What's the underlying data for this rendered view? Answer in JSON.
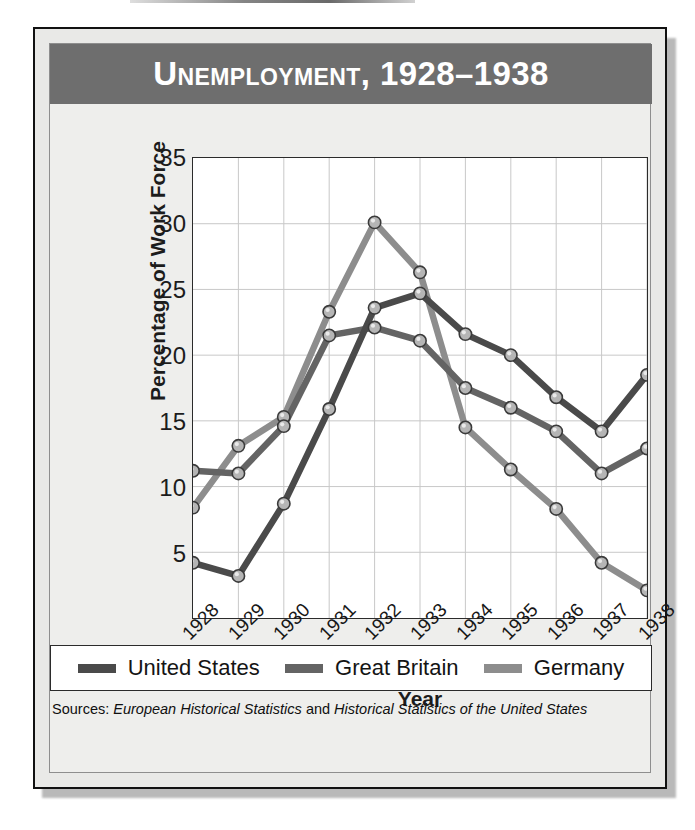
{
  "title": "Unemployment, 1928–1938",
  "colors": {
    "banner": "#6e6e6e",
    "united_states": "#4a4a4a",
    "great_britain": "#646464",
    "germany": "#8d8d8d",
    "plot_background": "#ffffff",
    "grid": "#c8c8c8",
    "frame": "#2b2b2b",
    "page_background": "#e9e9e7"
  },
  "axes": {
    "ylabel": "Percentage of Work Force",
    "xlabel": "Year",
    "yticks": [
      35,
      30,
      25,
      20,
      15,
      10,
      5
    ],
    "ylim": [
      0,
      35
    ],
    "xticks": [
      "1928",
      "1929",
      "1930",
      "1931",
      "1932",
      "1933",
      "1934",
      "1935",
      "1936",
      "1937",
      "1938"
    ]
  },
  "legend": {
    "items": [
      {
        "label": "United States",
        "color": "#4a4a4a"
      },
      {
        "label": "Great Britain",
        "color": "#646464"
      },
      {
        "label": "Germany",
        "color": "#8d8d8d"
      }
    ]
  },
  "sources": {
    "prefix": "Sources:",
    "first": "European Historical Statistics",
    "conjunction": "and",
    "second": "Historical Statistics of the United States"
  },
  "chart_data": {
    "type": "line",
    "title": "Unemployment, 1928–1938",
    "xlabel": "Year",
    "ylabel": "Percentage of Work Force",
    "ylim": [
      0,
      35
    ],
    "grid": true,
    "legend_position": "bottom",
    "markers": true,
    "categories": [
      "1928",
      "1929",
      "1930",
      "1931",
      "1932",
      "1933",
      "1934",
      "1935",
      "1936",
      "1937",
      "1938"
    ],
    "series": [
      {
        "name": "United States",
        "color": "#4a4a4a",
        "values": [
          4.2,
          3.2,
          8.7,
          15.9,
          23.6,
          24.7,
          21.6,
          20.0,
          16.8,
          14.2,
          18.5
        ]
      },
      {
        "name": "Great Britain",
        "color": "#646464",
        "values": [
          11.2,
          11.0,
          14.6,
          21.5,
          22.1,
          21.1,
          17.5,
          16.0,
          14.2,
          11.0,
          12.9
        ]
      },
      {
        "name": "Germany",
        "color": "#8d8d8d",
        "values": [
          8.4,
          13.1,
          15.3,
          23.3,
          30.1,
          26.3,
          14.5,
          11.3,
          8.3,
          4.2,
          2.1
        ]
      }
    ]
  }
}
